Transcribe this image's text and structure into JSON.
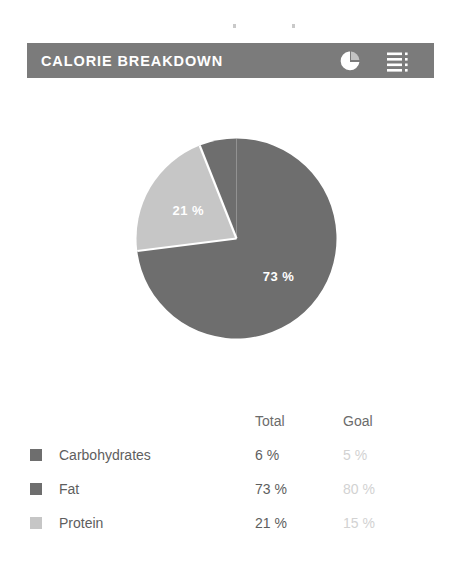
{
  "header": {
    "title": "CALORIE BREAKDOWN",
    "bar_color": "#7b7b7b",
    "title_color": "#ffffff",
    "pie_icon": "pie-chart-icon",
    "list_icon": "list-menu-icon"
  },
  "chart_data": {
    "type": "pie",
    "title": "CALORIE BREAKDOWN",
    "categories": [
      "Carbohydrates",
      "Fat",
      "Protein"
    ],
    "values": [
      6,
      73,
      21
    ],
    "unit": "%",
    "colors": [
      "#6e6e6e",
      "#6e6e6e",
      "#c6c6c6"
    ],
    "slice_labels": [
      {
        "category": "Fat",
        "text": "73 %",
        "value": 73
      },
      {
        "category": "Protein",
        "text": "21 %",
        "value": 21
      }
    ],
    "legend_position": "bottom",
    "grid": false,
    "xlabel": "",
    "ylabel": ""
  },
  "legend": {
    "columns": [
      "",
      "Total",
      "Goal"
    ],
    "header": {
      "name": "",
      "total": "Total",
      "goal": "Goal"
    },
    "rows": [
      {
        "swatch_color": "#6e6e6e",
        "name": "Carbohydrates",
        "total": "6 %",
        "goal": "5 %"
      },
      {
        "swatch_color": "#6e6e6e",
        "name": "Fat",
        "total": "73 %",
        "goal": "80 %"
      },
      {
        "swatch_color": "#c6c6c6",
        "name": "Protein",
        "total": "21 %",
        "goal": "15 %"
      }
    ]
  }
}
